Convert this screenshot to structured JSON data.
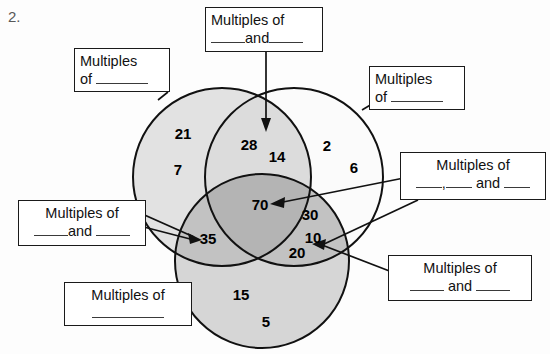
{
  "worksheet": {
    "question_number": "2.",
    "type": "three-circle-venn-diagram"
  },
  "venn": {
    "circles": [
      {
        "id": "left",
        "name": "left-circle",
        "fill": "#e2e2e2"
      },
      {
        "id": "right",
        "name": "right-circle",
        "fill": "#fbfbfb"
      },
      {
        "id": "bottom",
        "name": "bottom-circle",
        "fill": "#d6d6d6"
      }
    ],
    "overlap_colors": {
      "left_right": "#dcdcdc",
      "left_bottom": "#c2c2c2",
      "right_bottom": "#c2c2c2",
      "triple": "#b4b4b4"
    },
    "regions": [
      {
        "region": "left-only",
        "values": [
          "21",
          "7"
        ]
      },
      {
        "region": "left-right-overlap",
        "values": [
          "28",
          "14"
        ]
      },
      {
        "region": "right-only",
        "values": [
          "2",
          "6"
        ]
      },
      {
        "region": "triple-overlap",
        "values": [
          "70"
        ]
      },
      {
        "region": "left-bottom-overlap",
        "values": [
          "35"
        ]
      },
      {
        "region": "right-bottom-overlap",
        "values": [
          "30",
          "10",
          "20"
        ]
      },
      {
        "region": "bottom-only",
        "values": [
          "15",
          "5"
        ]
      }
    ],
    "numbers": {
      "n21": "21",
      "n7": "7",
      "n28": "28",
      "n14": "14",
      "n2": "2",
      "n6": "6",
      "n70": "70",
      "n30": "30",
      "n35": "35",
      "n10": "10",
      "n20": "20",
      "n15": "15",
      "n5": "5"
    }
  },
  "callouts": {
    "top_left": {
      "name": "callout-multiples-of-left",
      "line1": "Multiples",
      "line2_prefix": "of ",
      "blanks": 1,
      "points_to": "left-only"
    },
    "top_center": {
      "name": "callout-multiples-of-two",
      "line1": "Multiples of",
      "line2_mid": "and",
      "blanks": 2,
      "points_to": "left-right-overlap"
    },
    "top_right": {
      "name": "callout-multiples-of-right",
      "line1": "Multiples",
      "line2_prefix": "of ",
      "blanks": 1,
      "points_to": "right-only"
    },
    "middle_right": {
      "name": "callout-multiples-of-three",
      "line1": "Multiples of",
      "line2_sep": ",",
      "line2_mid": "and",
      "blanks": 3,
      "points_to": "triple-overlap"
    },
    "middle_left": {
      "name": "callout-multiples-of-left-bottom",
      "line1": "Multiples of",
      "line2_mid": "and",
      "blanks": 2,
      "points_to": "left-bottom-overlap"
    },
    "bottom_left": {
      "name": "callout-multiples-of-bottom",
      "line1": "Multiples of",
      "blanks": 1,
      "points_to": "bottom-only"
    },
    "bottom_right": {
      "name": "callout-multiples-of-right-bottom",
      "line1": "Multiples of",
      "line2_mid": "and",
      "blanks": 2,
      "points_to": "right-bottom-overlap"
    }
  }
}
